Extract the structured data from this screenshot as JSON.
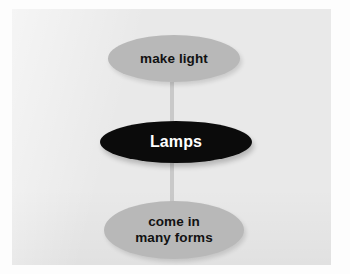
{
  "diagram": {
    "type": "concept-map",
    "orientation": "vertical",
    "background_color": "#e9e9e9",
    "page_color": "#fdfdfd",
    "connector_color": "#c9c9c9",
    "center_node": {
      "id": "lamps",
      "label": "Lamps",
      "shape": "ellipse",
      "fill_color": "#0b0b0b",
      "text_color": "#ffffff"
    },
    "nodes": [
      {
        "id": "make-light",
        "label": "make light",
        "lines": [
          "make light"
        ],
        "shape": "ellipse",
        "fill_color": "#b8b8b8",
        "text_color": "#121212",
        "position": "top"
      },
      {
        "id": "come-in-many-forms",
        "label": "come in many forms",
        "lines": [
          "come in",
          "many forms"
        ],
        "shape": "ellipse",
        "fill_color": "#b8b8b8",
        "text_color": "#121212",
        "position": "bottom"
      }
    ],
    "connectors": [
      {
        "id": "top-connector",
        "from": "make-light",
        "to": "lamps"
      },
      {
        "id": "bottom-connector",
        "from": "lamps",
        "to": "come-in-many-forms"
      }
    ]
  }
}
